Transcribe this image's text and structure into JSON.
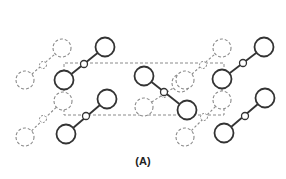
{
  "figure": {
    "label": "(A)",
    "colors": {
      "solid": "#333333",
      "dashed": "#8a8a8a",
      "background": "#ffffff"
    }
  },
  "unit_cell": {
    "x1": 64,
    "y1": 63,
    "x2": 224,
    "y2": 115
  },
  "molecules_solid": [
    {
      "a": [
        64,
        80
      ],
      "m": [
        84,
        64
      ],
      "b": [
        105,
        47
      ]
    },
    {
      "a": [
        66,
        134
      ],
      "m": [
        86,
        116
      ],
      "b": [
        107,
        99
      ]
    },
    {
      "a": [
        144,
        76
      ],
      "m": [
        164,
        92
      ],
      "b": [
        187,
        110
      ]
    },
    {
      "a": [
        222,
        79
      ],
      "m": [
        243,
        63
      ],
      "b": [
        264,
        47
      ]
    },
    {
      "a": [
        224,
        133
      ],
      "m": [
        245,
        116
      ],
      "b": [
        265,
        98
      ]
    }
  ],
  "molecules_dashed": [
    {
      "a": [
        25,
        80
      ],
      "m": [
        43,
        65
      ],
      "b": [
        62,
        48
      ]
    },
    {
      "a": [
        25,
        137
      ],
      "m": [
        43,
        119
      ],
      "b": [
        63,
        101
      ]
    },
    {
      "a": [
        144,
        107
      ],
      "m": [
        164,
        94
      ],
      "b": [
        181,
        83
      ]
    },
    {
      "a": [
        185,
        137
      ],
      "m": [
        204,
        117
      ],
      "b": [
        222,
        100
      ]
    },
    {
      "a": [
        185,
        80
      ],
      "m": [
        203,
        65
      ],
      "b": [
        222,
        48
      ]
    }
  ]
}
